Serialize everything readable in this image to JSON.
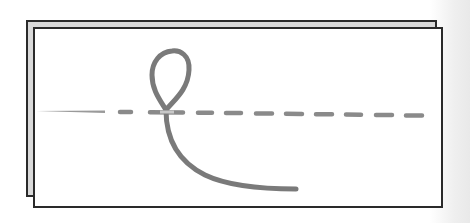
{
  "diagram": {
    "type": "stitch-illustration",
    "colors": {
      "background": "#ffffff",
      "sheet_fill": "#ffffff",
      "sheet_edge_fill": "#d9d9d9",
      "outline": "#2a2a2a",
      "thread": "#7a7a7a",
      "needle": "#9a9a9a",
      "scan_background": "#ececec"
    },
    "back_sheet": {
      "x": 27,
      "y": 21,
      "w": 409,
      "h": 175
    },
    "front_sheet": {
      "x": 34,
      "y": 28,
      "w": 408,
      "h": 179
    },
    "needle": {
      "x1": 36,
      "y1": 111,
      "x2": 105,
      "y2": 112
    },
    "stitch_line": {
      "dashes": [
        {
          "x1": 120,
          "x2": 132
        },
        {
          "x1": 150,
          "x2": 183
        },
        {
          "x1": 197,
          "x2": 213
        },
        {
          "x1": 225,
          "x2": 242
        },
        {
          "x1": 255,
          "x2": 273
        },
        {
          "x1": 285,
          "x2": 303
        },
        {
          "x1": 315,
          "x2": 333
        },
        {
          "x1": 345,
          "x2": 362
        },
        {
          "x1": 375,
          "x2": 393
        },
        {
          "x1": 405,
          "x2": 423
        }
      ],
      "y_start": 112,
      "y_end": 116
    },
    "thread_loop": {
      "top": [
        172,
        51
      ],
      "left": [
        152,
        75
      ],
      "right": [
        189,
        68
      ],
      "crossing": [
        166,
        110
      ],
      "tail_end": [
        296,
        189
      ]
    }
  }
}
